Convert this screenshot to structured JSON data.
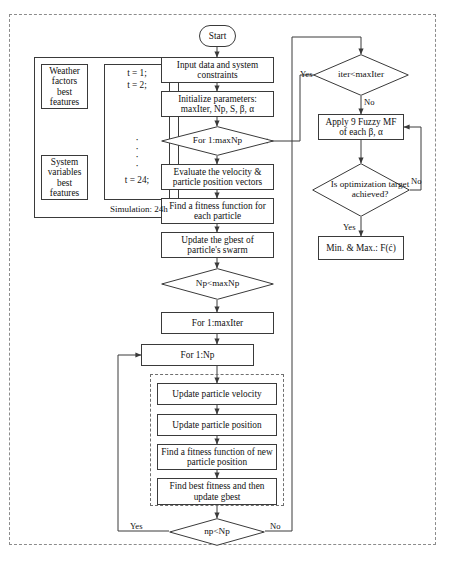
{
  "diagram": {
    "type": "flowchart",
    "start": {
      "label": "Start"
    },
    "left_group": {
      "inputs": [
        {
          "label": "Weather factors best features"
        },
        {
          "label": "System variables best features"
        }
      ],
      "time_steps": {
        "first": "t = 1;",
        "second": "t = 2;",
        "dots": "·",
        "last": "t = 24;"
      },
      "caption": "Simulation: 24h"
    },
    "main_nodes": {
      "input_data": "Input data and system constraints",
      "initialize": "Initialize parameters: maxIter, Np, S, β, α",
      "for_maxnp": "For 1:maxNp",
      "evaluate": "Evaluate the velocity & particle position vectors",
      "fitness_each": "Find a fitness function for each particle",
      "update_gbest": "Update the gbest of particle's swarm",
      "np_lt_maxnp": "Np<maxNp",
      "for_maxiter": "For 1:maxIter",
      "for_np": "For 1:Np",
      "update_velocity": "Update particle velocity",
      "update_position": "Update particle position",
      "fitness_new": "Find a fitness function of new particle position",
      "best_fitness": "Find best fitness and then update gbest",
      "np_lt_np": "np<Np"
    },
    "right_nodes": {
      "iter_lt_maxiter": "iter<maxIter",
      "apply_fuzzy": "Apply 9 Fuzzy MF of each β, α",
      "is_target": "Is optimization target achieved?",
      "result": "Min. & Max.: F(ć)"
    },
    "edge_labels": {
      "iter_yes": "Yes",
      "iter_no": "No",
      "target_no": "No",
      "target_yes": "Yes",
      "np_yes": "Yes",
      "np_no": "No"
    },
    "colors": {
      "stroke": "#3a3a3a",
      "dashed": "#8c8c8c",
      "background": "#ffffff",
      "text": "#111111"
    }
  }
}
